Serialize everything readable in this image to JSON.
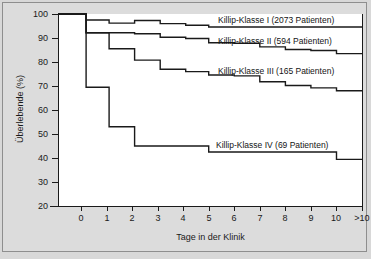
{
  "chart_data": {
    "type": "line",
    "subtype": "kaplan-meier-step",
    "title": "",
    "xlabel": "Tage in der Klinik",
    "ylabel": "Überlebende (%)",
    "xlim": [
      -0.9,
      11.0
    ],
    "ylim": [
      20,
      100
    ],
    "grid": false,
    "legend_position": "inline-right",
    "xticks": [
      0,
      1,
      2,
      3,
      4,
      5,
      6,
      7,
      8,
      9,
      10,
      11
    ],
    "xtick_labels": [
      "0",
      "1",
      "2",
      "3",
      "4",
      "5",
      "6",
      "7",
      "8",
      "9",
      "10",
      ">10"
    ],
    "yticks": [
      20,
      30,
      40,
      50,
      60,
      70,
      80,
      90,
      100
    ],
    "ytick_labels": [
      "20",
      "30",
      "40",
      "50",
      "60",
      "70",
      "80",
      "90",
      "100"
    ],
    "line_color": "#1a1a1a",
    "plot_background": "#ffffff",
    "figure_background": "#dcdcdc",
    "series": [
      {
        "name": "Killip-Klasse I",
        "patients": 2073,
        "label": "Killip-Klasse I (2073 Patienten)",
        "x": [
          -0.9,
          0.2,
          1.1,
          2.1,
          3.1,
          4.1,
          5.0,
          6.0,
          11.0
        ],
        "values": [
          100,
          97.5,
          96.2,
          97.3,
          96.0,
          95.3,
          94.6,
          94.6,
          94.6
        ]
      },
      {
        "name": "Killip-Klasse II",
        "patients": 594,
        "label": "Killip-Klasse II (594 Patienten)",
        "x": [
          -0.9,
          0.2,
          1.1,
          2.1,
          3.1,
          4.1,
          5.0,
          6.0,
          7.0,
          8.0,
          9.0,
          10.0,
          11.0
        ],
        "values": [
          100,
          92.2,
          92.2,
          91.8,
          90.3,
          89.8,
          88.0,
          87.8,
          86.3,
          85.2,
          84.8,
          83.5,
          83.4
        ]
      },
      {
        "name": "Killip-Klasse III",
        "patients": 165,
        "label": "Killip-Klasse III (165 Patienten)",
        "x": [
          -0.9,
          0.2,
          1.1,
          2.1,
          3.1,
          4.1,
          5.0,
          6.0,
          7.0,
          8.0,
          9.0,
          10.0,
          11.0
        ],
        "values": [
          100,
          92.2,
          85.5,
          80.8,
          77.0,
          76.0,
          74.6,
          74.2,
          71.8,
          70.2,
          69.2,
          68.0,
          68.0
        ]
      },
      {
        "name": "Killip-Klasse IV",
        "patients": 69,
        "label": "Killip-Klasse IV (69 Patienten)",
        "x": [
          -0.9,
          0.2,
          1.1,
          2.1,
          5.0,
          10.0,
          11.0
        ],
        "values": [
          100,
          69.5,
          53.0,
          45.0,
          42.5,
          39.4,
          39.4
        ]
      }
    ]
  },
  "series_labels": {
    "s1": "Killip-Klasse I (2073 Patienten)",
    "s2": "Killip-Klasse II (594 Patienten)",
    "s3": "Killip-Klasse III (165 Patienten)",
    "s4": "Killip-Klasse IV (69 Patienten)"
  },
  "axes": {
    "xlabel": "Tage in der Klinik",
    "ylabel": "Überlebende (%)"
  },
  "yticks": [
    "100",
    "90",
    "80",
    "70",
    "60",
    "50",
    "40",
    "30",
    "20"
  ],
  "xticks": [
    "0",
    "1",
    "2",
    "3",
    "4",
    "5",
    "6",
    "7",
    "8",
    "9",
    "10",
    ">10"
  ]
}
